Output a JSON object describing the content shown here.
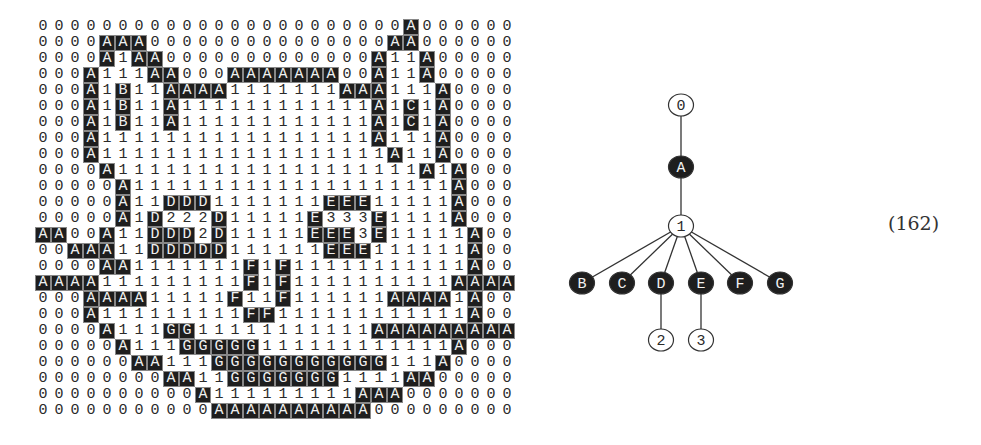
{
  "grid": {
    "rows": [
      "00000000000000000000000A000000",
      "0000AAA000000000000000AA000000",
      "0000A1AA0000000000000A11A00000",
      "000A111AA000AAAAAAA00A11A00000",
      "000A1B11AAAA1111111AAA111A0000",
      "000A1B11A111111111111A1C1A0000",
      "000A1B11A111111111111A1C1A0000",
      "000A11111111111111111A111A0000",
      "000A111111111111111111A11A0000",
      "0000A1111111111111111111A1A000",
      "00000A11111111111111111111A000",
      "00000A11DDD1111111EEE11111A000",
      "00000A1D222D11111E333E1111A000",
      "AA00A11DDD2D11111EEE3E11111A00",
      "00AAA11DDDDD111111EEE111111A00",
      "0000AA1111111F1F11111111111A00",
      "AAAA111111111F1F1111111111AAAA",
      "000AAAA11111F11F111111AAAA1A00",
      "000A111111111FF111111111111A00",
      "0000A111GG11111111111AAAAAAAAA",
      "00000A111GGGGG111111111111A000",
      "000000AA111GGGGGGGGGGG111A0000",
      "00000000AA11GGGGGGG1111AA00000",
      "0000000000A111111111AAA0000000",
      "00000000000AAAAAAAAAA000000000"
    ],
    "dark_symbols": [
      "A",
      "B",
      "C",
      "D",
      "E",
      "F",
      "G"
    ],
    "light_symbols": [
      "0",
      "1",
      "2",
      "3"
    ]
  },
  "tree": {
    "nodes": [
      {
        "id": "n0",
        "label": "0",
        "x": 681,
        "y": 105,
        "filled": false
      },
      {
        "id": "nA",
        "label": "A",
        "x": 681,
        "y": 167,
        "filled": true
      },
      {
        "id": "n1",
        "label": "1",
        "x": 681,
        "y": 226,
        "filled": false
      },
      {
        "id": "nB",
        "label": "B",
        "x": 582,
        "y": 283,
        "filled": true
      },
      {
        "id": "nC",
        "label": "C",
        "x": 622,
        "y": 283,
        "filled": true
      },
      {
        "id": "nD",
        "label": "D",
        "x": 661,
        "y": 283,
        "filled": true
      },
      {
        "id": "nE",
        "label": "E",
        "x": 701,
        "y": 283,
        "filled": true
      },
      {
        "id": "nF",
        "label": "F",
        "x": 740,
        "y": 283,
        "filled": true
      },
      {
        "id": "nG",
        "label": "G",
        "x": 780,
        "y": 283,
        "filled": true
      },
      {
        "id": "n2",
        "label": "2",
        "x": 661,
        "y": 340,
        "filled": false
      },
      {
        "id": "n3",
        "label": "3",
        "x": 701,
        "y": 340,
        "filled": false
      }
    ],
    "edges": [
      [
        "n0",
        "nA"
      ],
      [
        "nA",
        "n1"
      ],
      [
        "n1",
        "nB"
      ],
      [
        "n1",
        "nC"
      ],
      [
        "n1",
        "nD"
      ],
      [
        "n1",
        "nE"
      ],
      [
        "n1",
        "nF"
      ],
      [
        "n1",
        "nG"
      ],
      [
        "nD",
        "n2"
      ],
      [
        "nE",
        "n3"
      ]
    ]
  },
  "equation_label": "(162)",
  "colors": {
    "dark_fill": "#1e1e1e",
    "light_fill": "#ffffff",
    "stroke": "#333333"
  }
}
